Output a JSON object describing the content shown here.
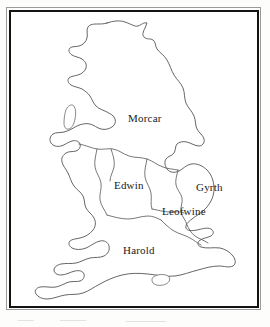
{
  "figure": {
    "kind": "historical-map",
    "region": "England",
    "background_color": "#fdfdfc",
    "frame": {
      "outer_color": "#9a9a9a",
      "inner_color": "#131313"
    },
    "ink_color": "#4a4a4a"
  },
  "map": {
    "labels": [
      {
        "id": "morcar",
        "text": "Morcar",
        "x": 128,
        "y": 119
      },
      {
        "id": "edwin",
        "text": "Edwin",
        "x": 114,
        "y": 186
      },
      {
        "id": "gyrth",
        "text": "Gyrth",
        "x": 196,
        "y": 188
      },
      {
        "id": "leofwine",
        "text": "Leofwine",
        "x": 162,
        "y": 211
      },
      {
        "id": "harold",
        "text": "Harold",
        "x": 123,
        "y": 250
      }
    ],
    "islands": [
      {
        "id": "isle-of-man"
      },
      {
        "id": "isle-of-wight"
      }
    ],
    "territories": [
      "Morcar",
      "Edwin",
      "Gyrth",
      "Leofwine",
      "Harold"
    ]
  }
}
